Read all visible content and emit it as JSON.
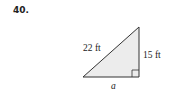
{
  "problem": {
    "number": "40."
  },
  "figure": {
    "type": "right-triangle",
    "hypotenuse_label": "22 ft",
    "vertical_leg_label": "15 ft",
    "horizontal_leg_label": "a",
    "fill_color": "#ececec",
    "stroke_color": "#333333"
  }
}
